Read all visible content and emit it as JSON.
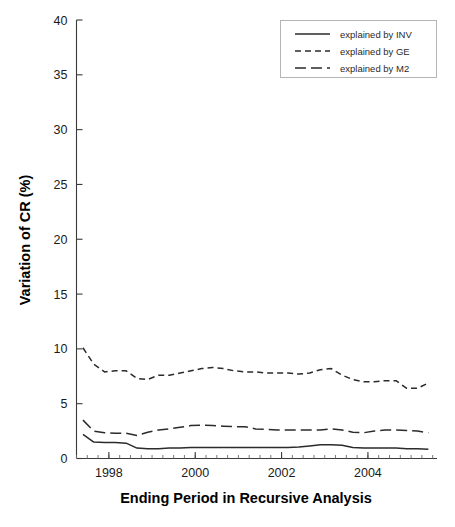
{
  "chart_data": {
    "type": "line",
    "title": "",
    "xlabel": "Ending Period in Recursive Analysis",
    "ylabel": "Variation of CR (%)",
    "xlim": [
      1997.25,
      2005.6
    ],
    "ylim": [
      0,
      40
    ],
    "yticks": [
      0,
      5,
      10,
      15,
      20,
      25,
      30,
      35,
      40
    ],
    "ytick_labels": [
      "0",
      "5",
      "10",
      "15",
      "20",
      "25",
      "30",
      "35",
      "40"
    ],
    "xticks": [
      1998,
      2000,
      2002,
      2004
    ],
    "xtick_labels": [
      "1998",
      "2000",
      "2002",
      "2004"
    ],
    "xminor_step": 0.25,
    "grid": false,
    "legend_position": "top-right",
    "x": [
      1997.4,
      1997.65,
      1997.9,
      1998.15,
      1998.4,
      1998.65,
      1998.9,
      1999.15,
      1999.4,
      1999.65,
      1999.9,
      2000.15,
      2000.4,
      2000.65,
      2000.9,
      2001.15,
      2001.4,
      2001.65,
      2001.9,
      2002.15,
      2002.4,
      2002.65,
      2002.9,
      2003.15,
      2003.4,
      2003.65,
      2003.9,
      2004.15,
      2004.4,
      2004.65,
      2004.9,
      2005.15,
      2005.4
    ],
    "series": [
      {
        "name": "explained by INV",
        "style": "solid",
        "values": [
          2.2,
          1.5,
          1.45,
          1.45,
          1.4,
          0.95,
          0.9,
          0.9,
          0.95,
          0.95,
          1.0,
          1.0,
          1.0,
          1.0,
          1.0,
          1.0,
          1.0,
          1.0,
          1.0,
          1.0,
          1.05,
          1.15,
          1.25,
          1.25,
          1.2,
          1.0,
          0.95,
          0.95,
          0.95,
          0.95,
          0.9,
          0.9,
          0.85
        ]
      },
      {
        "name": "explained by GE",
        "style": "dashed-short",
        "values": [
          10.1,
          8.6,
          7.9,
          8.0,
          8.0,
          7.3,
          7.2,
          7.6,
          7.6,
          7.8,
          8.0,
          8.2,
          8.3,
          8.2,
          8.0,
          7.9,
          7.9,
          7.8,
          7.8,
          7.8,
          7.7,
          7.8,
          8.1,
          8.2,
          7.6,
          7.2,
          7.0,
          7.0,
          7.1,
          7.1,
          6.4,
          6.4,
          6.9
        ]
      },
      {
        "name": "explained by M2",
        "style": "dashed-long",
        "values": [
          3.5,
          2.5,
          2.35,
          2.3,
          2.3,
          2.1,
          2.4,
          2.6,
          2.7,
          2.85,
          3.0,
          3.05,
          3.0,
          2.95,
          2.9,
          2.9,
          2.7,
          2.65,
          2.6,
          2.6,
          2.6,
          2.6,
          2.6,
          2.7,
          2.6,
          2.4,
          2.35,
          2.5,
          2.6,
          2.6,
          2.55,
          2.5,
          2.35
        ]
      }
    ],
    "legend_entries": [
      {
        "label": "explained by INV",
        "style": "solid"
      },
      {
        "label": "explained by GE",
        "style": "dashed-short"
      },
      {
        "label": "explained by M2",
        "style": "dashed-long"
      }
    ]
  }
}
